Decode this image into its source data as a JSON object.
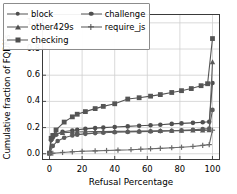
{
  "chart_data": {
    "type": "line",
    "title": "",
    "xlabel": "Refusal Percentage",
    "ylabel": "Cumulative fraction of FQDNs",
    "xlim": [
      -4,
      104
    ],
    "ylim": [
      -0.04,
      1.06
    ],
    "xticks": [
      0,
      20,
      40,
      60,
      80,
      100
    ],
    "xticklabels": [
      "0",
      "20",
      "40",
      "60",
      "80",
      "100"
    ],
    "yticks": [
      0.0,
      0.2,
      0.4,
      0.6,
      0.8,
      1.0
    ],
    "yticklabels": [
      "0.0",
      "0.2",
      "0.4",
      "0.6",
      "0.8",
      "1.0"
    ],
    "grid": true,
    "legend_position": "upper left",
    "legend_ncol": 2,
    "series": [
      {
        "name": "block",
        "marker": "circle",
        "color": "#4f4f4f",
        "x": [
          0,
          1,
          2,
          4,
          8,
          14,
          17,
          22,
          28,
          33,
          40,
          48,
          55,
          62,
          68,
          75,
          81,
          88,
          94,
          98,
          100
        ],
        "y": [
          0.005,
          0.105,
          0.125,
          0.145,
          0.168,
          0.178,
          0.183,
          0.19,
          0.196,
          0.2,
          0.205,
          0.209,
          0.214,
          0.218,
          0.222,
          0.228,
          0.232,
          0.236,
          0.241,
          0.245,
          0.54
        ]
      },
      {
        "name": "other429s",
        "marker": "triangle",
        "color": "#5a5a5a",
        "x": [
          0,
          1,
          2,
          4,
          8,
          14,
          17,
          22,
          28,
          33,
          40,
          48,
          55,
          62,
          68,
          75,
          81,
          88,
          94,
          98,
          100
        ],
        "y": [
          0.004,
          0.118,
          0.14,
          0.152,
          0.16,
          0.164,
          0.166,
          0.168,
          0.169,
          0.17,
          0.171,
          0.172,
          0.173,
          0.174,
          0.175,
          0.176,
          0.177,
          0.178,
          0.179,
          0.18,
          0.7
        ]
      },
      {
        "name": "checking",
        "marker": "square",
        "color": "#555555",
        "x": [
          0,
          1,
          2,
          4,
          9,
          14,
          17,
          22,
          28,
          33,
          40,
          48,
          55,
          62,
          68,
          75,
          81,
          87,
          93,
          97,
          100
        ],
        "y": [
          0.005,
          0.118,
          0.14,
          0.182,
          0.242,
          0.282,
          0.302,
          0.322,
          0.345,
          0.362,
          0.382,
          0.418,
          0.428,
          0.44,
          0.452,
          0.468,
          0.482,
          0.498,
          0.52,
          0.535,
          0.88
        ]
      },
      {
        "name": "challenge",
        "marker": "circle",
        "color": "#5c5c5c",
        "x": [
          0,
          2,
          5,
          9,
          14,
          17,
          22,
          28,
          33,
          40,
          48,
          55,
          62,
          68,
          75,
          81,
          88,
          94,
          98,
          100
        ],
        "y": [
          0.002,
          0.06,
          0.098,
          0.122,
          0.14,
          0.146,
          0.152,
          0.158,
          0.161,
          0.164,
          0.167,
          0.169,
          0.171,
          0.173,
          0.176,
          0.179,
          0.183,
          0.188,
          0.192,
          0.335
        ]
      },
      {
        "name": "require_js",
        "marker": "plus",
        "color": "#6a6a6a",
        "x": [
          0,
          2,
          8,
          14,
          20,
          28,
          35,
          42,
          50,
          56,
          62,
          68,
          75,
          81,
          88,
          94,
          98,
          100
        ],
        "y": [
          0.0,
          0.004,
          0.01,
          0.015,
          0.019,
          0.022,
          0.025,
          0.028,
          0.031,
          0.035,
          0.038,
          0.041,
          0.046,
          0.05,
          0.056,
          0.064,
          0.07,
          0.18
        ]
      }
    ]
  },
  "legend": {
    "entries": [
      {
        "label": "block",
        "marker": "circle"
      },
      {
        "label": "challenge",
        "marker": "circle"
      },
      {
        "label": "other429s",
        "marker": "triangle"
      },
      {
        "label": "require_js",
        "marker": "plus"
      },
      {
        "label": "checking",
        "marker": "square"
      }
    ]
  }
}
